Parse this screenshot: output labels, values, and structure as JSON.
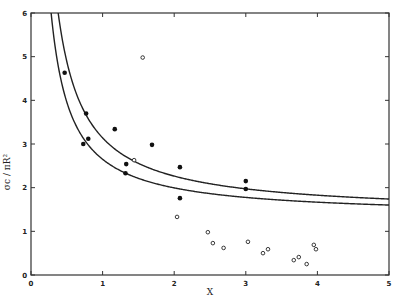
{
  "chart_data": {
    "type": "scatter",
    "title": "",
    "xlabel": "X",
    "ylabel": "σc / πR²",
    "xlim": [
      0,
      5
    ],
    "ylim": [
      0,
      6
    ],
    "x_ticks": [
      "0",
      "1",
      "2",
      "3",
      "4",
      "5"
    ],
    "y_ticks": [
      "0",
      "1",
      "2",
      "3",
      "4",
      "5",
      "6"
    ],
    "grid": false,
    "legend": null,
    "series": [
      {
        "name": "filled points",
        "marker": "filled-circle",
        "points": [
          [
            0.47,
            4.63
          ],
          [
            0.77,
            3.7
          ],
          [
            0.73,
            3.0
          ],
          [
            0.8,
            3.12
          ],
          [
            1.17,
            3.34
          ],
          [
            1.33,
            2.54
          ],
          [
            1.32,
            2.33
          ],
          [
            1.69,
            2.98
          ],
          [
            2.08,
            2.47
          ],
          [
            2.08,
            1.76
          ],
          [
            3.0,
            2.15
          ],
          [
            3.0,
            1.97
          ]
        ]
      },
      {
        "name": "open points",
        "marker": "open-circle",
        "points": [
          [
            1.56,
            4.98
          ],
          [
            1.44,
            2.63
          ],
          [
            2.04,
            1.33
          ],
          [
            2.47,
            0.98
          ],
          [
            2.54,
            0.73
          ],
          [
            2.69,
            0.62
          ],
          [
            3.03,
            0.76
          ],
          [
            3.24,
            0.5
          ],
          [
            3.31,
            0.59
          ],
          [
            3.67,
            0.34
          ],
          [
            3.74,
            0.41
          ],
          [
            3.85,
            0.25
          ],
          [
            3.95,
            0.69
          ],
          [
            3.98,
            0.59
          ]
        ]
      },
      {
        "name": "upper curve",
        "type": "line",
        "formula": "y = 1.39 + 1.75/x",
        "a": 1.39,
        "b": 1.75
      },
      {
        "name": "lower curve",
        "type": "line",
        "formula": "y = 1.34 + 1.31/x",
        "a": 1.34,
        "b": 1.31
      }
    ]
  }
}
